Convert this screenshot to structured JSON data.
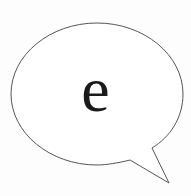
{
  "speech_bubble": {
    "text": "e",
    "stroke_color": "#555555",
    "fill_color": "#ffffff",
    "text_color": "#1a1a1a"
  }
}
